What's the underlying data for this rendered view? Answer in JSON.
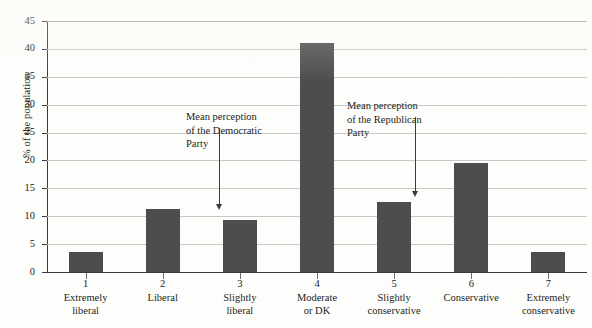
{
  "chart_data": {
    "type": "bar",
    "title": "",
    "xlabel": "",
    "ylabel": "% of the population",
    "ylim": [
      0,
      45
    ],
    "grid": true,
    "legend": "none",
    "categories": [
      "Extremely\nliberal",
      "Liberal",
      "Slightly\nliberal",
      "Moderate\nor DK",
      "Slightly\nconservative",
      "Conservative",
      "Extremely\nconservative"
    ],
    "category_numbers": [
      "1",
      "2",
      "3",
      "4",
      "5",
      "6",
      "7"
    ],
    "values": [
      3.6,
      11.3,
      9.3,
      41.0,
      12.5,
      19.6,
      3.5
    ],
    "y_ticks": [
      0,
      5,
      10,
      15,
      20,
      25,
      30,
      35,
      40,
      45
    ],
    "bar_color": "#4d4d4d",
    "gridline_color": "#c9c9c4",
    "axis_color": "#3a3a3a",
    "annotations": [
      {
        "id": "mean-perception-democratic",
        "text": "Mean perception\nof the Democratic\nParty",
        "points_to_category": "3",
        "arrow": "down"
      },
      {
        "id": "mean-perception-republican",
        "text": "Mean perception\nof the Republican\nParty",
        "points_to_category": "5",
        "arrow": "down"
      }
    ]
  },
  "axis": {
    "y_title": "% of the population",
    "y_tick_labels": [
      "45",
      "40",
      "35",
      "30",
      "25",
      "20",
      "15",
      "10",
      "5",
      "0"
    ]
  },
  "annotations": {
    "democratic": {
      "line1": "Mean perception",
      "line2": "of the Democratic",
      "line3": "Party",
      "full": "Mean perception\nof the Democratic\nParty"
    },
    "republican": {
      "line1": "Mean perception",
      "line2": "of the Republican",
      "line3": "Party",
      "full": "Mean perception\nof the Republican\nParty"
    }
  },
  "x_labels": [
    {
      "num": "1",
      "cat": "Extremely\nliberal"
    },
    {
      "num": "2",
      "cat": "Liberal"
    },
    {
      "num": "3",
      "cat": "Slightly\nliberal"
    },
    {
      "num": "4",
      "cat": "Moderate\nor DK"
    },
    {
      "num": "5",
      "cat": "Slightly\nconservative"
    },
    {
      "num": "6",
      "cat": "Conservative"
    },
    {
      "num": "7",
      "cat": "Extremely\nconservative"
    }
  ]
}
